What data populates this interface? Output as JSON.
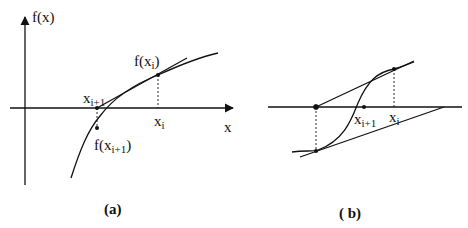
{
  "panel_a": {
    "caption": "(a)",
    "y_axis_label": "f(x)",
    "x_axis_label": "x",
    "labels": {
      "f_xi": "f(x",
      "f_xi_sub": "i",
      "f_xi_close": ")",
      "xi1": "x",
      "xi1_sub": "i+1",
      "xi": "x",
      "xi_sub": "i",
      "f_xi1": "f(x",
      "f_xi1_sub": "i+1",
      "f_xi1_close": ")"
    }
  },
  "panel_b": {
    "caption": "( b)",
    "labels": {
      "xi1": "x",
      "xi1_sub": "i+1",
      "xi": "x",
      "xi_sub": "i"
    }
  },
  "colors": {
    "line": "#111111",
    "background": "#ffffff"
  }
}
